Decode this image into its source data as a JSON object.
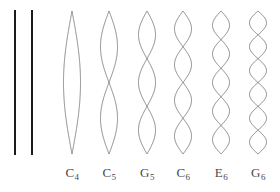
{
  "figure": {
    "background_color": "#ffffff",
    "straight_line_color": "#1a1a1a",
    "wave_color": "#6b6b6b",
    "label_color": "#4a4a4a",
    "straight_lines": [
      {
        "name": "string-line-1",
        "x": 15,
        "y_top": 10,
        "y_bottom": 155,
        "width": 2
      },
      {
        "name": "string-line-2",
        "x": 32,
        "y_top": 10,
        "y_bottom": 155,
        "width": 2
      }
    ],
    "waves": [
      {
        "id": "wave-c4",
        "note": "C",
        "octave": "4",
        "harmonic": 1,
        "antinodes": 1,
        "center_x": 72,
        "amplitude": 8.5
      },
      {
        "id": "wave-c5",
        "note": "C",
        "octave": "5",
        "harmonic": 2,
        "antinodes": 2,
        "center_x": 109,
        "amplitude": 8.5
      },
      {
        "id": "wave-g5",
        "note": "G",
        "octave": "5",
        "harmonic": 3,
        "antinodes": 3,
        "center_x": 147,
        "amplitude": 8.5
      },
      {
        "id": "wave-c6",
        "note": "C",
        "octave": "6",
        "harmonic": 4,
        "antinodes": 4,
        "center_x": 183,
        "amplitude": 8.5
      },
      {
        "id": "wave-e6",
        "note": "E",
        "octave": "6",
        "harmonic": 5,
        "antinodes": 5,
        "center_x": 221,
        "amplitude": 8.5
      },
      {
        "id": "wave-g6",
        "note": "G",
        "octave": "6",
        "harmonic": 6,
        "antinodes": 6,
        "center_x": 258,
        "amplitude": 8.5
      }
    ],
    "wave_y_top": 11,
    "wave_y_bottom": 154,
    "labels": [
      {
        "id": "label-c4",
        "note": "C",
        "octave": "4",
        "center_x": 72,
        "y": 166
      },
      {
        "id": "label-c5",
        "note": "C",
        "octave": "5",
        "center_x": 109,
        "y": 166
      },
      {
        "id": "label-g5",
        "note": "G",
        "octave": "5",
        "center_x": 147,
        "y": 166
      },
      {
        "id": "label-c6",
        "note": "C",
        "octave": "6",
        "center_x": 183,
        "y": 166
      },
      {
        "id": "label-e6",
        "note": "E",
        "octave": "6",
        "center_x": 221,
        "y": 166
      },
      {
        "id": "label-g6",
        "note": "G",
        "octave": "6",
        "center_x": 258,
        "y": 166
      }
    ]
  }
}
